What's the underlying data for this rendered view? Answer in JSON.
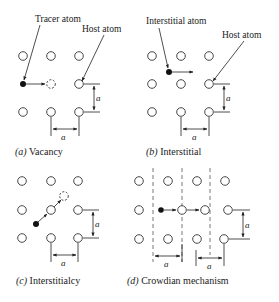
{
  "figure": {
    "panels": [
      {
        "id": "a",
        "caption_label": "(a)",
        "caption_text": "Vacancy",
        "labels": {
          "tracer": "Tracer atom",
          "host": "Host atom"
        },
        "dim_horizontal": "a",
        "dim_vertical": "a"
      },
      {
        "id": "b",
        "caption_label": "(b)",
        "caption_text": "Interstitial",
        "labels": {
          "interstitial": "Interstitial atom",
          "host": "Host atom"
        },
        "dim_horizontal": "a",
        "dim_vertical": "a"
      },
      {
        "id": "c",
        "caption_label": "(c)",
        "caption_text": "Interstitialcy",
        "dim_horizontal": "a",
        "dim_vertical": "a"
      },
      {
        "id": "d",
        "caption_label": "(d)",
        "caption_text": "Crowdian mechanism",
        "dim_horizontal_1": "a",
        "dim_horizontal_2": "a",
        "dim_vertical": "a"
      }
    ]
  },
  "colors": {
    "atom_outline": "#333333",
    "solid_atom": "#111111",
    "text": "#1a1a1a",
    "background": "#ffffff"
  }
}
